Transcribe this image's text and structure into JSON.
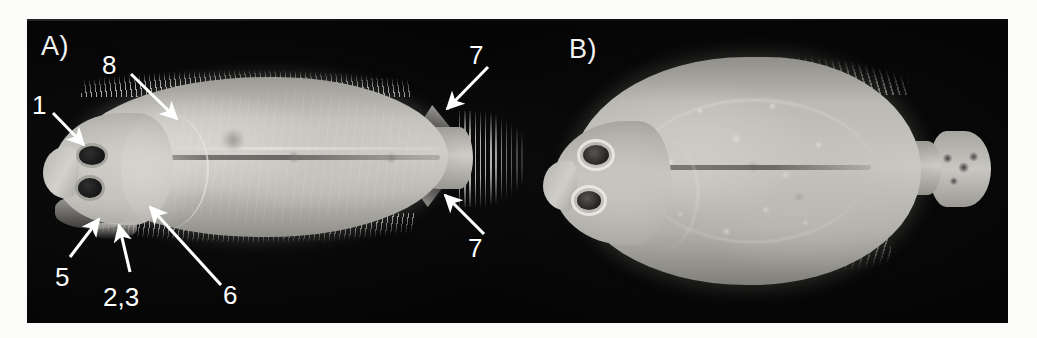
{
  "figure": {
    "background_color": "#fbfbfa",
    "plate_color": "#050505",
    "annotation_color": "#ffffff"
  },
  "panels": [
    {
      "id": "A",
      "label": "A)",
      "subject": "flatfish-lateral-view-eyed-side",
      "annotations": [
        {
          "id": "a1",
          "label": "1",
          "name": "annotation-1"
        },
        {
          "id": "a8",
          "label": "8",
          "name": "annotation-8"
        },
        {
          "id": "a7t",
          "label": "7",
          "name": "annotation-7-upper"
        },
        {
          "id": "a7b",
          "label": "7",
          "name": "annotation-7-lower"
        },
        {
          "id": "a5",
          "label": "5",
          "name": "annotation-5"
        },
        {
          "id": "a23",
          "label": "2,3",
          "name": "annotation-2-3"
        },
        {
          "id": "a6",
          "label": "6",
          "name": "annotation-6"
        }
      ]
    },
    {
      "id": "B",
      "label": "B)",
      "subject": "flatfish-lateral-view-blind-side",
      "annotations": []
    }
  ]
}
